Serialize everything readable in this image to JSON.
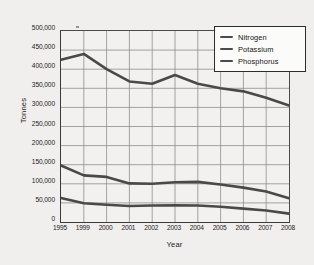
{
  "chart_data": {
    "type": "line",
    "title": "",
    "xlabel": "Year",
    "ylabel": "Tonnes",
    "categories": [
      "1995",
      "1999",
      "2000",
      "2001",
      "2002",
      "2003",
      "2004",
      "2005",
      "2006",
      "2007",
      "2008"
    ],
    "ylim": [
      0,
      500000
    ],
    "ytick_values": [
      0,
      50000,
      100000,
      150000,
      200000,
      250000,
      300000,
      350000,
      400000,
      450000,
      500000
    ],
    "ytick_labels": [
      "0",
      "50,000",
      "100,000",
      "150,000",
      "200,000",
      "250,000",
      "300,000",
      "350,000",
      "400,000",
      "450,000",
      "500,000"
    ],
    "grid": true,
    "legend_position": "top-right",
    "series": [
      {
        "name": "Nitrogen",
        "color": "#4a4a4a",
        "values": [
          425000,
          440000,
          400000,
          368000,
          362000,
          385000,
          362000,
          350000,
          342000,
          325000,
          305000
        ]
      },
      {
        "name": "Potassium",
        "color": "#4a4a4a",
        "values": [
          148000,
          122000,
          118000,
          101000,
          100000,
          104000,
          105000,
          98000,
          90000,
          80000,
          62000
        ]
      },
      {
        "name": "Phosphorus",
        "color": "#4a4a4a",
        "values": [
          63000,
          49000,
          45000,
          42000,
          43000,
          44000,
          43000,
          40000,
          35000,
          30000,
          22000
        ]
      }
    ]
  },
  "legend": {
    "items": [
      {
        "label": "Nitrogen"
      },
      {
        "label": "Potassium"
      },
      {
        "label": "Phosphorus"
      }
    ]
  }
}
